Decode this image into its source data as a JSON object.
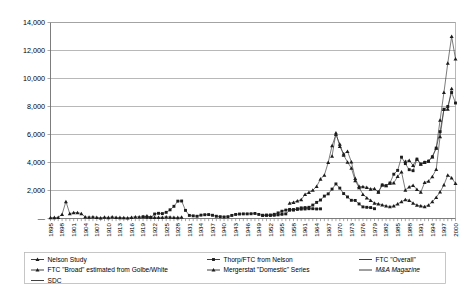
{
  "chart_data": {
    "type": "line",
    "title": "",
    "xlabel": "",
    "ylabel": "",
    "ylim": [
      0,
      14000
    ],
    "y_ticks": [
      "—",
      "2,000",
      "4,000",
      "6,000",
      "8,000",
      "10,000",
      "12,000",
      "14,000"
    ],
    "y_tick_values": [
      0,
      2000,
      4000,
      6000,
      8000,
      10000,
      12000,
      14000
    ],
    "grid": true,
    "legend_position": "bottom",
    "x_tick_labels": [
      "1895",
      "1898",
      "1901",
      "1904",
      "1907",
      "1910",
      "1913",
      "1916",
      "1919",
      "1922",
      "1925",
      "1928",
      "1931",
      "1934",
      "1937",
      "1940",
      "1943",
      "1946",
      "1949",
      "1952",
      "1955",
      "1958",
      "1961",
      "1964",
      "1967",
      "1970",
      "1973",
      "1976",
      "1979",
      "1982",
      "1985",
      "1988",
      "1991",
      "1994",
      "1997",
      "2000"
    ],
    "x_start_year": 1895,
    "x_end_year": 2000,
    "series": [
      {
        "name": "Nelson Study",
        "marker": "triangle",
        "x_start": 1895,
        "values": [
          60,
          70,
          80,
          300,
          1210,
          340,
          420,
          420,
          350,
          110,
          90,
          120,
          80,
          50,
          90,
          70,
          110,
          80,
          70,
          60,
          50,
          80,
          120,
          110,
          130,
          180,
          110,
          80,
          80,
          80,
          120,
          100,
          80,
          70,
          90
        ]
      },
      {
        "name": "Thorp/FTC from Nelson",
        "marker": "square",
        "x_start": 1919,
        "values": [
          120,
          80,
          70,
          320,
          370,
          350,
          440,
          620,
          870,
          1240,
          1250,
          580,
          220,
          190,
          160,
          240,
          270,
          280,
          230,
          160,
          130,
          110,
          130,
          220,
          290,
          320,
          330,
          330,
          340,
          360,
          290,
          230,
          230,
          220,
          230,
          260,
          300,
          330,
          590,
          640,
          650,
          670,
          680,
          700,
          700,
          680,
          690
        ]
      },
      {
        "name": "FTC \"Overall\"",
        "marker": "square",
        "x_start": 1950,
        "values": [
          220,
          240,
          250,
          300,
          400,
          520,
          600,
          650,
          600,
          700,
          760,
          780,
          800,
          960,
          1150,
          1320,
          1600,
          1760,
          2100,
          2470,
          2170,
          1780,
          1540,
          1300,
          1290,
          1040,
          830,
          800,
          780,
          700
        ]
      },
      {
        "name": "FTC \"Broad\" estimated from Golbe/White",
        "marker": "triangle",
        "x_start": 1957,
        "values": [
          1100,
          1150,
          1260,
          1350,
          1720,
          1870,
          2020,
          2290,
          2820,
          3100,
          4000,
          5200,
          6000,
          5310,
          4520,
          4030,
          3600,
          2700,
          2210,
          1730,
          1480,
          1300,
          1100,
          1050,
          980,
          900,
          850,
          900,
          1050,
          1200,
          1350,
          1300,
          1100,
          950,
          900,
          850,
          950,
          1200,
          1500,
          1900,
          2400,
          3100,
          2900,
          2500
        ]
      },
      {
        "name": "Mergerstat \"Domestic\" Series",
        "marker": "triangle",
        "x_start": 1968,
        "values": [
          4462,
          6107,
          5152,
          4608,
          4801,
          4040,
          2861,
          2297,
          2276,
          2224,
          2106,
          2128,
          1889,
          2395,
          2346,
          2533,
          2543,
          3001,
          3336,
          2032,
          2258,
          2366,
          2074,
          1877,
          2574,
          2663,
          2997,
          3510,
          5848,
          7800,
          7809,
          9278
        ]
      },
      {
        "name": "M&A Magazine",
        "marker": "square",
        "x_start": 1980,
        "values": [
          1889,
          2395,
          2346,
          2533,
          3164,
          3437,
          4381,
          3920,
          3487,
          3415,
          4239,
          3889,
          4012,
          4096,
          4409,
          5030,
          6202,
          7800,
          8000,
          9000,
          8250
        ]
      },
      {
        "name": "SDC",
        "marker": "triangle",
        "x_start": 1987,
        "values": [
          4082,
          4155,
          3787,
          4239,
          3889,
          4012,
          4096,
          4409,
          5030,
          7019,
          9000,
          11100,
          13000,
          11400
        ]
      }
    ]
  },
  "legend": {
    "items": [
      {
        "label": "Nelson Study",
        "marker": "triangle",
        "italic": false
      },
      {
        "label": "Thorp/FTC from Nelson",
        "marker": "square",
        "italic": false
      },
      {
        "label": "FTC \"Overall\"",
        "marker": "line",
        "italic": false
      },
      {
        "label": "FTC \"Broad\" estimated from Golbe/White",
        "marker": "triangle",
        "italic": false
      },
      {
        "label": "Mergerstat \"Domestic\" Series",
        "marker": "triangle",
        "italic": false
      },
      {
        "label": "M&A Magazine",
        "marker": "line",
        "italic": true
      },
      {
        "label": "SDC",
        "marker": "line",
        "italic": false
      }
    ]
  },
  "colors": {
    "line": "#2b2b2b",
    "grid": "#9a9a9a",
    "axis": "#6e6e6e",
    "legend_border": "#b9b9b9",
    "background": "#ffffff"
  }
}
